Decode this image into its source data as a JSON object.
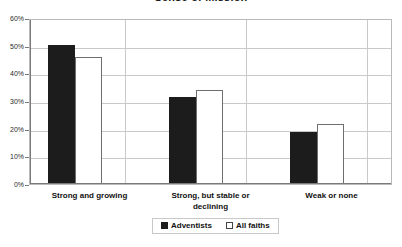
{
  "chart_data": {
    "type": "bar",
    "title": "Sense of Mission",
    "xlabel": "",
    "ylabel": "",
    "ylim": [
      0,
      60
    ],
    "ytick_labels": [
      "60%",
      "50%",
      "40%",
      "30%",
      "20%",
      "10%",
      "0%"
    ],
    "ytick_values": [
      60,
      50,
      40,
      30,
      20,
      10,
      0
    ],
    "grid": true,
    "legend_position": "bottom",
    "categories": [
      "Strong and growing",
      "Strong, but stable or declining",
      "Weak or none"
    ],
    "series": [
      {
        "name": "Adventists",
        "color": "#1c1c1c",
        "values": [
          51,
          32,
          19
        ]
      },
      {
        "name": "All faiths",
        "color": "#ffffff",
        "values": [
          46.5,
          34.5,
          22
        ]
      }
    ]
  },
  "category_lines": [
    [
      "Strong and growing"
    ],
    [
      "Strong, but stable or",
      "declining"
    ],
    [
      "Weak or none"
    ]
  ],
  "legend": {
    "items": [
      {
        "label": "Adventists",
        "swatch": "filled-square-icon"
      },
      {
        "label": "All faiths",
        "swatch": "empty-square-icon"
      }
    ]
  }
}
